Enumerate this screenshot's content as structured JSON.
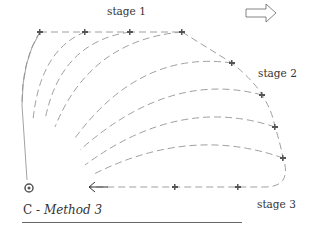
{
  "labels": {
    "stage1": "stage 1",
    "stage2": "stage 2",
    "stage3": "stage 3"
  },
  "caption": {
    "prefix": "C - ",
    "method": "Method 3"
  },
  "icons": {
    "direction_arrow": "hollow-right-arrow",
    "return_arrow": "left-arrow",
    "aircraft": "aircraft-icon",
    "origin": "origin-marker"
  },
  "colors": {
    "line": "#9a9a9a",
    "text": "#333333",
    "plane": "#555555"
  }
}
